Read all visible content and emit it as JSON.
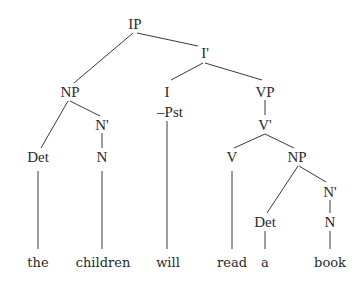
{
  "diagram": {
    "type": "syntax-tree",
    "line_color": "#3a3a3a",
    "nodes": {
      "ip": {
        "label": "IP",
        "x": 135,
        "y": 24
      },
      "np1": {
        "label": "NP",
        "x": 70,
        "y": 92
      },
      "ibar": {
        "label": "I'",
        "x": 205,
        "y": 53
      },
      "nbar1": {
        "label": "N'",
        "x": 102,
        "y": 125
      },
      "det1": {
        "label": "Det",
        "x": 38,
        "y": 157
      },
      "n1": {
        "label": "N",
        "x": 102,
        "y": 157
      },
      "i": {
        "label": "I",
        "x": 167,
        "y": 92
      },
      "pst": {
        "label": "–Pst",
        "x": 170,
        "y": 112
      },
      "vp": {
        "label": "VP",
        "x": 265,
        "y": 92
      },
      "vbar": {
        "label": "V'",
        "x": 265,
        "y": 125
      },
      "v": {
        "label": "V",
        "x": 232,
        "y": 157
      },
      "np2": {
        "label": "NP",
        "x": 297,
        "y": 157
      },
      "nbar2": {
        "label": "N'",
        "x": 330,
        "y": 192
      },
      "det2": {
        "label": "Det",
        "x": 265,
        "y": 222
      },
      "n2": {
        "label": "N",
        "x": 330,
        "y": 222
      }
    },
    "leaves": [
      {
        "word": "the",
        "x": 38,
        "y": 262
      },
      {
        "word": "children",
        "x": 103,
        "y": 262
      },
      {
        "word": "will",
        "x": 168,
        "y": 262
      },
      {
        "word": "read",
        "x": 232,
        "y": 262
      },
      {
        "word": "a",
        "x": 265,
        "y": 262
      },
      {
        "word": "book",
        "x": 330,
        "y": 262
      }
    ],
    "edges": [
      {
        "from": "ip",
        "to": "np1",
        "x1": 133,
        "y1": 33,
        "x2": 74,
        "y2": 83
      },
      {
        "from": "ip",
        "to": "ibar",
        "x1": 137,
        "y1": 33,
        "x2": 198,
        "y2": 46
      },
      {
        "from": "np1",
        "to": "det1",
        "x1": 68,
        "y1": 101,
        "x2": 41,
        "y2": 148
      },
      {
        "from": "np1",
        "to": "nbar1",
        "x1": 70,
        "y1": 101,
        "x2": 100,
        "y2": 116
      },
      {
        "from": "nbar1",
        "to": "n1",
        "x1": 102,
        "y1": 133,
        "x2": 102,
        "y2": 148
      },
      {
        "from": "ibar",
        "to": "i",
        "x1": 203,
        "y1": 63,
        "x2": 171,
        "y2": 80
      },
      {
        "from": "ibar",
        "to": "vp",
        "x1": 205,
        "y1": 63,
        "x2": 262,
        "y2": 80
      },
      {
        "from": "vp",
        "to": "vbar",
        "x1": 265,
        "y1": 100,
        "x2": 265,
        "y2": 115
      },
      {
        "from": "vbar",
        "to": "v",
        "x1": 265,
        "y1": 134,
        "x2": 234,
        "y2": 148
      },
      {
        "from": "vbar",
        "to": "np2",
        "x1": 265,
        "y1": 134,
        "x2": 294,
        "y2": 148
      },
      {
        "from": "np2",
        "to": "det2",
        "x1": 298,
        "y1": 166,
        "x2": 267,
        "y2": 213
      },
      {
        "from": "np2",
        "to": "nbar2",
        "x1": 299,
        "y1": 166,
        "x2": 326,
        "y2": 182
      },
      {
        "from": "nbar2",
        "to": "n2",
        "x1": 330,
        "y1": 200,
        "x2": 330,
        "y2": 213
      },
      {
        "from": "det1",
        "to": "the",
        "x1": 38,
        "y1": 171,
        "x2": 38,
        "y2": 249
      },
      {
        "from": "n1",
        "to": "children",
        "x1": 102,
        "y1": 171,
        "x2": 102,
        "y2": 249
      },
      {
        "from": "pst",
        "to": "will",
        "x1": 167,
        "y1": 121,
        "x2": 167,
        "y2": 249
      },
      {
        "from": "v",
        "to": "read",
        "x1": 232,
        "y1": 171,
        "x2": 232,
        "y2": 249
      },
      {
        "from": "det2",
        "to": "a",
        "x1": 265,
        "y1": 231,
        "x2": 265,
        "y2": 249
      },
      {
        "from": "n2",
        "to": "book",
        "x1": 330,
        "y1": 231,
        "x2": 330,
        "y2": 249
      }
    ]
  }
}
